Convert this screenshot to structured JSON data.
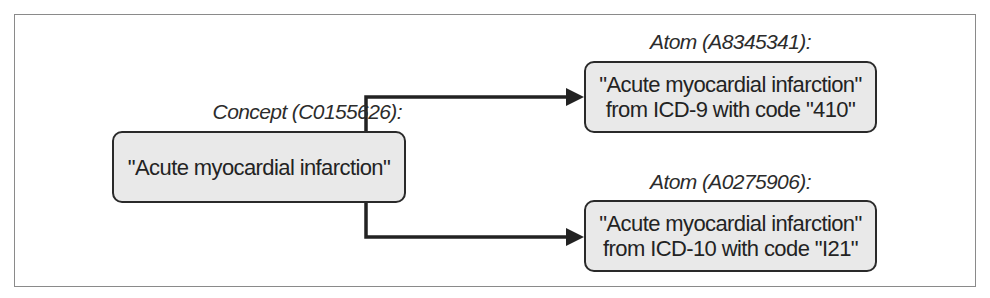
{
  "diagram": {
    "concept": {
      "label": "Concept (C0155626):",
      "text_lines": [
        "\"Acute myocardial infarction\""
      ]
    },
    "atoms": [
      {
        "label": "Atom (A8345341):",
        "text_lines": [
          "\"Acute myocardial infarction\"",
          "from ICD-9 with code \"410\""
        ]
      },
      {
        "label": "Atom (A0275906):",
        "text_lines": [
          "\"Acute myocardial infarction\"",
          "from ICD-10 with code \"I21\""
        ]
      }
    ],
    "edges": [
      {
        "from": "concept",
        "to": "atom-1"
      },
      {
        "from": "concept",
        "to": "atom-2"
      }
    ],
    "colors": {
      "node_fill": "#e9e9e9",
      "node_border": "#2a2a2a",
      "frame_border": "#8a8a8a",
      "arrow": "#222222"
    }
  }
}
